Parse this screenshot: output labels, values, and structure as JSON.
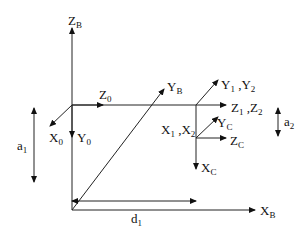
{
  "diagram": {
    "labels": {
      "zb": {
        "main": "Z",
        "sub": "B"
      },
      "yb": {
        "main": "Y",
        "sub": "B"
      },
      "xb": {
        "main": "X",
        "sub": "B"
      },
      "z0": {
        "main": "Z",
        "sub": "0"
      },
      "x0": {
        "main": "X",
        "sub": "0"
      },
      "y0": {
        "main": "Y",
        "sub": "0"
      },
      "y12": {
        "main1": "Y",
        "sub1": "1",
        "sep": " ,",
        "main2": "Y",
        "sub2": "2"
      },
      "z12": {
        "main1": "Z",
        "sub1": "1",
        "sep": " ,",
        "main2": "Z",
        "sub2": "2"
      },
      "x12": {
        "main1": "X",
        "sub1": "1",
        "sep": " ,",
        "main2": "X",
        "sub2": "2"
      },
      "yc": {
        "main": "Y",
        "sub": "C"
      },
      "zc": {
        "main": "Z",
        "sub": "C"
      },
      "xc": {
        "main": "X",
        "sub": "C"
      },
      "a1": {
        "main": "a",
        "sub": "1"
      },
      "a2": {
        "main": "a",
        "sub": "2"
      },
      "d1": {
        "main": "d",
        "sub": "1"
      }
    }
  }
}
